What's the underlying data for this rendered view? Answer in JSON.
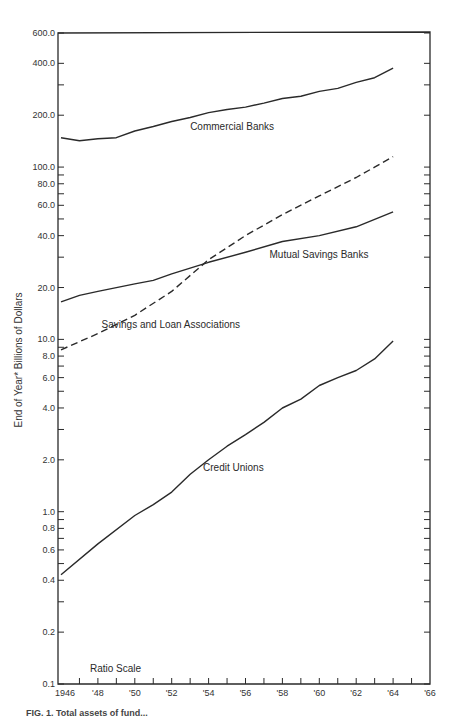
{
  "chart_data": {
    "type": "line",
    "title": "",
    "xlabel": "",
    "ylabel": "End of Year* Billions of Dollars",
    "yscale": "log",
    "scale_note": "Ratio Scale",
    "ylim": [
      0.1,
      600.0
    ],
    "xlim": [
      1946,
      1966
    ],
    "y_ticks": [
      "600.0",
      "400.0",
      "200.0",
      "100.0",
      "80.0",
      "60.0",
      "40.0",
      "20.0",
      "10.0",
      "8.0",
      "6.0",
      "4.0",
      "2.0",
      "1.0",
      "0.8",
      "0.6",
      "0.4",
      "0.2",
      "0.1"
    ],
    "y_tick_values": [
      600,
      400,
      200,
      100,
      80,
      60,
      40,
      20,
      10,
      8,
      6,
      4,
      2,
      1,
      0.8,
      0.6,
      0.4,
      0.2,
      0.1
    ],
    "x_ticks": [
      "1946",
      "'48",
      "'50",
      "'52",
      "'54",
      "'56",
      "'58",
      "'60",
      "'62",
      "'64",
      "'66"
    ],
    "x_tick_values": [
      1946,
      1948,
      1950,
      1952,
      1954,
      1956,
      1958,
      1960,
      1962,
      1964,
      1966
    ],
    "grid": false,
    "legend": "inline labels",
    "series": [
      {
        "name": "Commercial Banks",
        "style": "solid",
        "x": [
          1946,
          1947,
          1948,
          1949,
          1950,
          1951,
          1952,
          1953,
          1954,
          1955,
          1956,
          1957,
          1958,
          1959,
          1960,
          1961,
          1962,
          1963,
          1964
        ],
        "values": [
          148,
          142,
          146,
          148,
          162,
          172,
          184,
          194,
          207,
          216,
          223,
          235,
          250,
          258,
          275,
          286,
          310,
          330,
          375
        ],
        "label_pos": [
          1953,
          165
        ]
      },
      {
        "name": "Savings and Loan Associations",
        "style": "dashed",
        "x": [
          1946,
          1948,
          1950,
          1952,
          1954,
          1956,
          1958,
          1960,
          1962,
          1963,
          1964
        ],
        "values": [
          8.7,
          10.8,
          13.8,
          19.0,
          29.0,
          40.0,
          53.0,
          68.0,
          87.0,
          100.0,
          115.0
        ],
        "label_pos": [
          1948.2,
          11.6
        ]
      },
      {
        "name": "Mutual Savings Banks",
        "style": "solid",
        "x": [
          1946,
          1947,
          1948,
          1950,
          1951,
          1952,
          1954,
          1956,
          1958,
          1960,
          1962,
          1964
        ],
        "values": [
          16.5,
          18.0,
          19.0,
          21.0,
          22.0,
          24.0,
          28.0,
          32.0,
          37.0,
          40.0,
          45.0,
          55.0
        ],
        "label_pos": [
          1957.3,
          29.5
        ]
      },
      {
        "name": "Credit Unions",
        "style": "solid",
        "x": [
          1946,
          1948,
          1950,
          1951,
          1952,
          1953,
          1954,
          1955,
          1956,
          1957,
          1958,
          1959,
          1960,
          1961,
          1962,
          1963,
          1964
        ],
        "values": [
          0.43,
          0.65,
          0.95,
          1.1,
          1.3,
          1.65,
          2.0,
          2.4,
          2.8,
          3.3,
          4.0,
          4.5,
          5.4,
          6.0,
          6.6,
          7.7,
          9.8
        ],
        "label_pos": [
          1953.7,
          1.72
        ]
      }
    ]
  },
  "labels": {
    "ratio_scale": "Ratio Scale",
    "y_axis_title": "End of Year*  Billions of Dollars",
    "caption": "FIG. 1. Total assets of fund..."
  }
}
